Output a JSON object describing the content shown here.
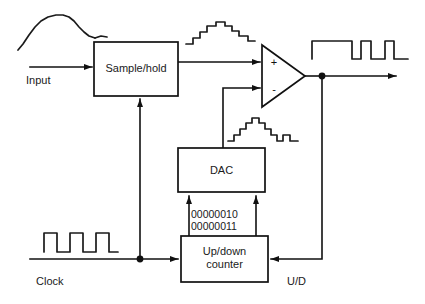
{
  "diagram": {
    "blocks": [
      {
        "id": "sample-hold",
        "label": "Sample/hold",
        "x": 94,
        "y": 42,
        "w": 84,
        "h": 54
      },
      {
        "id": "dac",
        "label": "DAC",
        "x": 178,
        "y": 148,
        "w": 87,
        "h": 44
      },
      {
        "id": "up-down-counter",
        "label_line1": "Up/down",
        "label_line2": "counter",
        "x": 181,
        "y": 236,
        "w": 87,
        "h": 46
      }
    ],
    "comparator": {
      "id": "comparator",
      "plus_label": "+",
      "minus_label": "-",
      "apex_x": 305,
      "apex_y": 76,
      "left_x": 262,
      "top_y": 45,
      "bottom_y": 107
    },
    "signal_labels": [
      {
        "id": "input-label",
        "text": "Input",
        "x": 26,
        "y": 84
      },
      {
        "id": "clock-label",
        "text": "Clock",
        "x": 36,
        "y": 285
      },
      {
        "id": "updown-label",
        "text": "U/D",
        "x": 287,
        "y": 285
      }
    ],
    "bus_values": [
      {
        "id": "bus-value-upper",
        "text": "00000010",
        "x": 191,
        "y": 218
      },
      {
        "id": "bus-value-lower",
        "text": "00000011",
        "x": 191,
        "y": 230
      }
    ],
    "waveforms": [
      {
        "id": "input-analog-waveform",
        "kind": "analog-hump",
        "caption": "analog input curve"
      },
      {
        "id": "sampled-staircase-waveform",
        "kind": "staircase",
        "caption": "sampled/held staircase"
      },
      {
        "id": "comparator-output-waveform",
        "kind": "pulse-train",
        "caption": "comparator digital output pulses"
      },
      {
        "id": "dac-output-staircase-waveform",
        "kind": "staircase",
        "caption": "DAC reconstructed staircase"
      },
      {
        "id": "clock-waveform",
        "kind": "square-wave",
        "caption": "clock square wave"
      }
    ],
    "colors": {
      "line": "#111111",
      "text": "#1a1a1a",
      "background": "#ffffff"
    }
  }
}
